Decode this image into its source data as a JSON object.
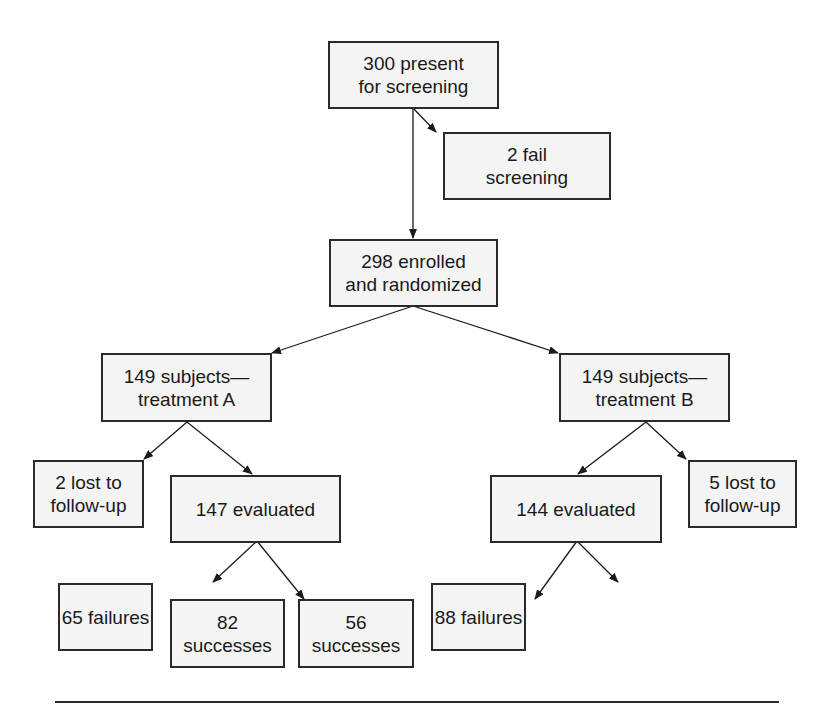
{
  "diagram": {
    "type": "flowchart",
    "nodes": {
      "screening": "300 present\nfor screening",
      "fail_screening": "2 fail\nscreening",
      "enrolled": "298 enrolled\nand randomized",
      "treatment_a": "149 subjects—\ntreatment A",
      "treatment_b": "149 subjects—\ntreatment B",
      "lost_a": "2 lost to\nfollow-up",
      "evaluated_a": "147 evaluated",
      "lost_b": "5 lost to\nfollow-up",
      "evaluated_b": "144 evaluated",
      "failures_a": "65 failures",
      "successes_a": "82 successes",
      "successes_b": "56 successes",
      "failures_b": "88 failures"
    },
    "edges": [
      [
        "screening",
        "fail_screening"
      ],
      [
        "screening",
        "enrolled"
      ],
      [
        "enrolled",
        "treatment_a"
      ],
      [
        "enrolled",
        "treatment_b"
      ],
      [
        "treatment_a",
        "lost_a"
      ],
      [
        "treatment_a",
        "evaluated_a"
      ],
      [
        "treatment_b",
        "evaluated_b"
      ],
      [
        "treatment_b",
        "lost_b"
      ],
      [
        "evaluated_a",
        "failures_a"
      ],
      [
        "evaluated_a",
        "successes_a"
      ],
      [
        "evaluated_b",
        "successes_b"
      ],
      [
        "evaluated_b",
        "failures_b"
      ]
    ]
  }
}
